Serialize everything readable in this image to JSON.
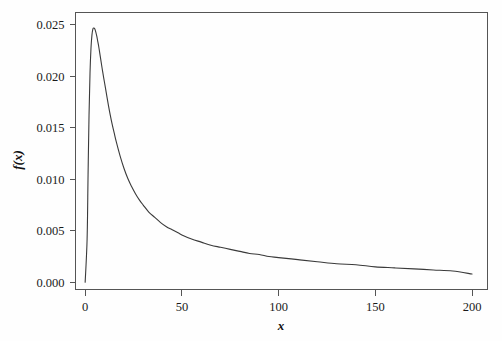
{
  "chart_data": {
    "type": "line",
    "title": "",
    "subtitle": "",
    "xlabel": "x",
    "ylabel": "f(x)",
    "xlim": [
      -5,
      208
    ],
    "ylim": [
      -0.0007,
      0.0262
    ],
    "grid": false,
    "legend": null,
    "annotations": [],
    "x_ticks": [
      0,
      50,
      100,
      150,
      200
    ],
    "x_tick_labels": [
      "0",
      "50",
      "100",
      "150",
      "200"
    ],
    "y_ticks": [
      0.0,
      0.005,
      0.01,
      0.015,
      0.02,
      0.025
    ],
    "y_tick_labels": [
      "0.000",
      "0.005",
      "0.010",
      "0.015",
      "0.020",
      "0.025"
    ],
    "series": [
      {
        "name": "f(x)",
        "color": "#3a3a3a",
        "x": [
          0,
          1,
          1.5,
          2,
          2.5,
          3,
          3.5,
          4,
          4.5,
          5,
          5.5,
          6,
          6.5,
          7,
          7.5,
          8,
          8.5,
          9,
          10,
          11,
          12,
          13,
          14,
          15,
          16,
          18,
          20,
          22,
          24,
          26,
          28,
          30,
          33,
          36,
          39,
          42,
          45,
          48,
          50,
          55,
          60,
          65,
          70,
          75,
          80,
          85,
          90,
          95,
          100,
          110,
          120,
          130,
          140,
          150,
          160,
          170,
          180,
          190,
          200
        ],
        "y": [
          0.0,
          0.0042,
          0.0105,
          0.0163,
          0.0203,
          0.0227,
          0.024,
          0.0246,
          0.0247,
          0.0246,
          0.0243,
          0.0239,
          0.0234,
          0.0229,
          0.0223,
          0.0217,
          0.0211,
          0.0205,
          0.0194,
          0.0183,
          0.0172,
          0.0162,
          0.0153,
          0.0145,
          0.0137,
          0.0123,
          0.0111,
          0.0101,
          0.0093,
          0.0086,
          0.008,
          0.0075,
          0.0068,
          0.0063,
          0.0058,
          0.0054,
          0.0051,
          0.0048,
          0.0046,
          0.0042,
          0.0039,
          0.0036,
          0.0034,
          0.0032,
          0.003,
          0.0028,
          0.0027,
          0.0025,
          0.0024,
          0.0022,
          0.002,
          0.0018,
          0.0017,
          0.0015,
          0.0014,
          0.0013,
          0.0012,
          0.0011,
          0.0008
        ]
      }
    ]
  },
  "figure": {
    "background_color": "#fefefe",
    "frame_color": "#555555",
    "curve_color": "#3a3a3a",
    "text_color": "#1a1a1a"
  }
}
